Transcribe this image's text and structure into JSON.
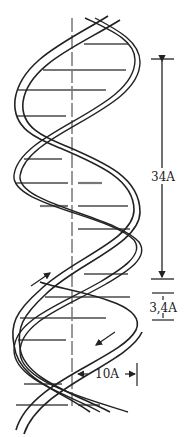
{
  "diagram": {
    "labels": {
      "pitch": "34A",
      "base_spacing": "3,4A",
      "radius": "10A"
    },
    "colors": {
      "stroke": "#222222",
      "background": "#ffffff",
      "rung": "#888888"
    }
  }
}
